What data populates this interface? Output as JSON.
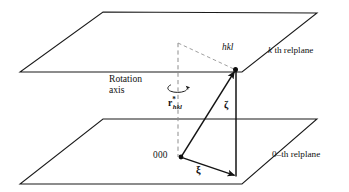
{
  "figure": {
    "domain": "diagram",
    "width": 349,
    "height": 192,
    "background_color": "#ffffff",
    "line_color": "#1a1a1a",
    "dash_color": "#8a8a8a"
  },
  "labels": {
    "upper_plane": {
      "italic_part": "k",
      "rest": " th relplane"
    },
    "lower_plane": {
      "text": "0–th relplane"
    },
    "rotation_axis_line1": "Rotation",
    "rotation_axis_line2": "axis",
    "hkl_point": "hkl",
    "origin_point": "000",
    "zeta_vertical": "ζ",
    "zeta_horizontal": "ξ",
    "r_vector": {
      "base": "r",
      "superscript": "*",
      "subscript": "hkl"
    }
  },
  "geometry": {
    "upper_plane_points": "103,12 317,13 242,72 20,72",
    "lower_plane_points": "103,119 317,119 242,184 20,184",
    "rotation_axis": {
      "x": 178,
      "y_top": 43,
      "y_bottom": 157
    },
    "hkl_node": {
      "x": 235.5,
      "y": 70
    },
    "origin_node": {
      "x": 181,
      "y": 157
    },
    "foot_node": {
      "x": 236,
      "y": 176
    },
    "zeta_vertical_segment": {
      "x": 236,
      "y_top": 70,
      "y_bottom": 176
    },
    "dashed_hypotenuse": {
      "x1": 178,
      "y1": 43,
      "x2": 234,
      "y2": 69
    },
    "rotation_arrow_center": {
      "x": 178,
      "y": 87
    }
  },
  "icons": {
    "rotation_arrow": "curved-rotation-arrow-icon",
    "hkl_dot": "filled-node-dot",
    "origin_dot": "filled-node-dot"
  }
}
